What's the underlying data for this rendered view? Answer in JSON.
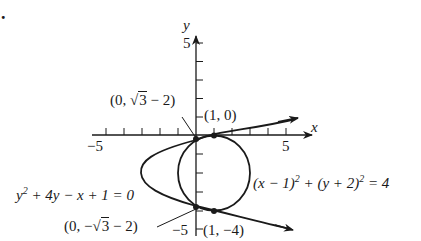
{
  "problem_marker": ".",
  "axes": {
    "x_label": "x",
    "y_label": "y",
    "x_tick_label_neg": "−5",
    "x_tick_label_pos": "5",
    "y_tick_label_pos": "5",
    "y_tick_label_neg": "−5",
    "x_range": [
      -5,
      5
    ],
    "y_range": [
      -5,
      5
    ]
  },
  "curves": {
    "circle": {
      "equation_lhs_a": "(x − 1)",
      "equation_exp_a": "2",
      "equation_mid": " + (y + 2)",
      "equation_exp_b": "2",
      "equation_rhs": " = 4",
      "center": [
        1,
        -2
      ],
      "radius": 2
    },
    "parabola": {
      "equation_a": "y",
      "equation_exp": "2",
      "equation_rest": " + 4y − x + 1 = 0",
      "vertex": [
        -3,
        -2
      ]
    }
  },
  "points": {
    "top_tangent": "(1, 0)",
    "bottom_tangent": "(1, −4)",
    "upper_intersection_prefix": "(0, ",
    "upper_intersection_sqrt": "3",
    "upper_intersection_suffix": " − 2)",
    "lower_intersection_prefix": "(0, −",
    "lower_intersection_sqrt": "3",
    "lower_intersection_suffix": " − 2)"
  },
  "colors": {
    "ink": "#1a1a1a",
    "background": "#ffffff"
  }
}
